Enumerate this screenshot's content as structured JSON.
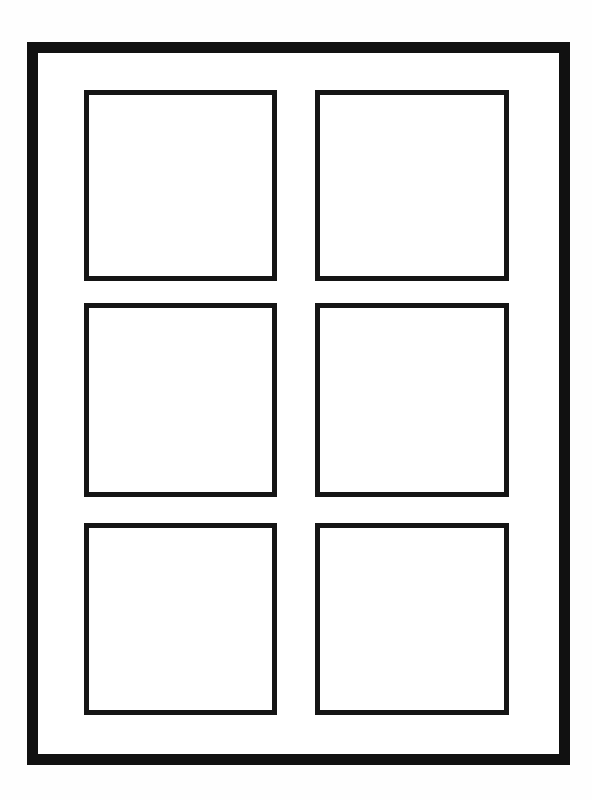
{
  "page": {
    "background_color": "#ffffff",
    "frame": {
      "stroke_color": "#111111",
      "stroke_width_px": 11,
      "rows": 3,
      "columns": 2
    },
    "cells": [
      {
        "row": 1,
        "col": 1,
        "label": ""
      },
      {
        "row": 1,
        "col": 2,
        "label": ""
      },
      {
        "row": 2,
        "col": 1,
        "label": ""
      },
      {
        "row": 2,
        "col": 2,
        "label": ""
      },
      {
        "row": 3,
        "col": 1,
        "label": ""
      },
      {
        "row": 3,
        "col": 2,
        "label": ""
      }
    ],
    "cell_stroke_color": "#151515",
    "cell_stroke_width_px": 5
  }
}
